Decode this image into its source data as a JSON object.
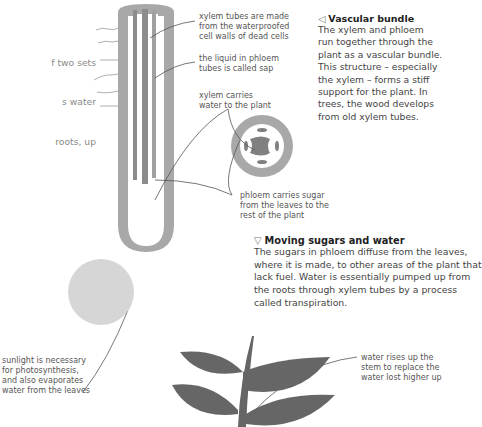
{
  "intro": {
    "lines": [
      "f two sets",
      "s water",
      "roots, up",
      "ugar made",
      "rm of",
      "ade from",
      " that form",
      "w."
    ]
  },
  "callouts": {
    "xylem_tubes": "xylem tubes are made\nfrom the waterproofed\ncell walls of dead cells",
    "phloem_sap": "the liquid in phloem\ntubes is called sap",
    "xylem_carries": "xylem carries\nwater to the plant",
    "phloem_carries": "phloem carries sugar\nfrom the leaves to the\nrest of the plant",
    "sunlight": "sunlight is necessary\nfor photosynthesis,\nand also evaporates\nwater from the leaves",
    "water_rises": "water rises up the\nstem to replace the\nwater lost higher up"
  },
  "vascular_bundle": {
    "icon": "triangle-left-icon",
    "title": "Vascular bundle",
    "body": "The xylem and phloem\nrun together through the\nplant as a vascular bundle.\nThis structure – especially\nthe xylem – forms a stiff\nsupport for the plant. In\ntrees, the wood develops\nfrom old xylem tubes."
  },
  "moving_sugars": {
    "icon": "triangle-down-icon",
    "title": "Moving sugars and water",
    "body": "The sugars in phloem diffuse from the leaves,\nwhere it is made, to other areas of the plant that\nlack fuel. Water is essentially pumped up from\nthe roots through xylem tubes by a process\ncalled transpiration."
  },
  "colors": {
    "stem_outer": "#a8a8a8",
    "stem_inner": "#d9d9d9",
    "tube_dark": "#8c8c8c",
    "leaf": "#666666",
    "sun": "#d6d6d6",
    "text": "#444444"
  }
}
